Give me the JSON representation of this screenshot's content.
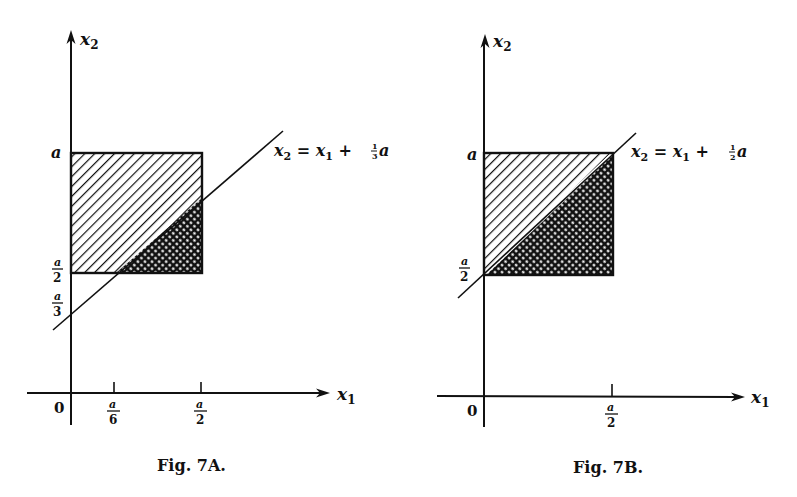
{
  "figures": [
    {
      "id": "7A",
      "caption": "Fig. 7A.",
      "axes": {
        "x_label": "x",
        "x_sub": "1",
        "y_label": "x",
        "y_sub": "2",
        "origin_label": "0"
      },
      "y_ticks": [
        {
          "label": "a"
        },
        {
          "num": "a",
          "den": "2"
        },
        {
          "num": "a",
          "den": "3"
        }
      ],
      "x_ticks": [
        {
          "num": "a",
          "den": "6"
        },
        {
          "num": "a",
          "den": "2"
        }
      ],
      "line_equation": {
        "lhs": "x",
        "lhs_sub": "2",
        "eq": " = ",
        "rhs": "x",
        "rhs_sub": "1",
        "plus": " + ",
        "frac_num": "1",
        "frac_den": "3",
        "tail": "a"
      },
      "regions": [
        "hatched (above line)",
        "cross-hatched (below line)"
      ]
    },
    {
      "id": "7B",
      "caption": "Fig. 7B.",
      "axes": {
        "x_label": "x",
        "x_sub": "1",
        "y_label": "x",
        "y_sub": "2",
        "origin_label": "0"
      },
      "y_ticks": [
        {
          "label": "a"
        },
        {
          "num": "a",
          "den": "2"
        }
      ],
      "x_ticks": [
        {
          "num": "a",
          "den": "2"
        }
      ],
      "line_equation": {
        "lhs": "x",
        "lhs_sub": "2",
        "eq": " = ",
        "rhs": "x",
        "rhs_sub": "1",
        "plus": " + ",
        "frac_num": "1",
        "frac_den": "2",
        "tail": "a"
      },
      "regions": [
        "hatched (above line)",
        "cross-hatched (below line)"
      ]
    }
  ]
}
